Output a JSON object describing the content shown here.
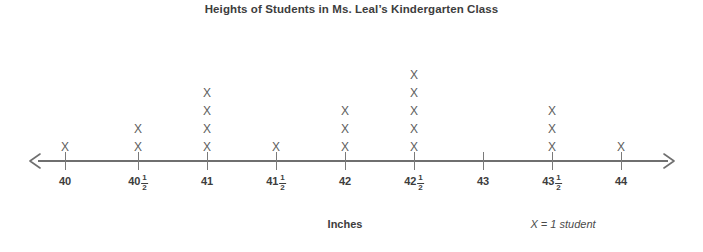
{
  "chart_data": {
    "type": "dot-plot",
    "title": "Heights of Students in Ms. Leal’s Kindergarten Class",
    "xlabel": "Inches",
    "ylabel": "",
    "legend": "X = 1 student",
    "marker": "X",
    "grid": false,
    "xlim": [
      40,
      44
    ],
    "categories": [
      "40",
      "40½",
      "41",
      "41½",
      "42",
      "42½",
      "43",
      "43½",
      "44"
    ],
    "x": [
      40,
      40.5,
      41,
      41.5,
      42,
      42.5,
      43,
      43.5,
      44
    ],
    "values": [
      1,
      2,
      4,
      1,
      3,
      5,
      0,
      3,
      1
    ],
    "total": 20,
    "ticks": [
      {
        "whole": "40",
        "num": "",
        "den": "",
        "count": 1,
        "pos": 65
      },
      {
        "whole": "40",
        "num": "1",
        "den": "2",
        "count": 2,
        "pos": 138
      },
      {
        "whole": "41",
        "num": "",
        "den": "",
        "count": 4,
        "pos": 207
      },
      {
        "whole": "41",
        "num": "1",
        "den": "2",
        "count": 1,
        "pos": 276
      },
      {
        "whole": "42",
        "num": "",
        "den": "",
        "count": 3,
        "pos": 345
      },
      {
        "whole": "42",
        "num": "1",
        "den": "2",
        "count": 5,
        "pos": 414
      },
      {
        "whole": "43",
        "num": "",
        "den": "",
        "count": 0,
        "pos": 483
      },
      {
        "whole": "43",
        "num": "1",
        "den": "2",
        "count": 3,
        "pos": 552
      },
      {
        "whole": "44",
        "num": "",
        "den": "",
        "count": 1,
        "pos": 621
      }
    ]
  },
  "colors": {
    "background": "#ffffff",
    "title_text": "#3d3d3d",
    "axis_line": "#6f6f6f",
    "tick_mark": "#7a7a7a",
    "marker_text": "#5d5d5d",
    "label_text": "#3d3d3d"
  }
}
